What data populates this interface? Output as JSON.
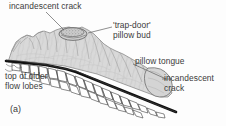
{
  "figure": {
    "caption_label": "(a)",
    "background_color": "#fdfdfd",
    "text_color": "#3b3b3b",
    "body_fill_color": "#d9d9d9",
    "crack_line_color": "#111111",
    "crust_block_color": "#ffffff"
  },
  "labels": {
    "incandescent_crack_top": "incandescent crack",
    "trap_door_pillow_bud_line1": "'trap-door'",
    "trap_door_pillow_bud_line2": "pillow bud",
    "pillow_tongue": "pillow tongue",
    "incandescent_crack_right_line1": "incandescent",
    "incandescent_crack_right_line2": "crack",
    "top_of_older_flow_lobes_line1": "top of older",
    "top_of_older_flow_lobes_line2": "flow lobes"
  },
  "diagram": {
    "type": "geological-cross-section",
    "elements": [
      "pillow lava flow body with lobate stippled surface",
      "oval trap-door pillow bud on upper surface",
      "bulbous pillow tongue at right terminus",
      "thick dark incandescent crack along flow base",
      "polygonal jointed crust blocks beneath crack",
      "older flow lobe tops at left"
    ]
  }
}
